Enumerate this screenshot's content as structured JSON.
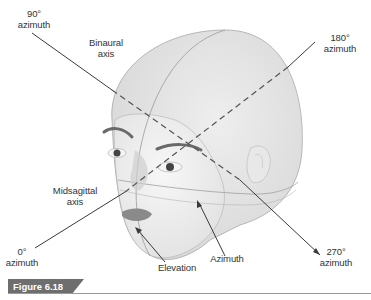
{
  "figure": {
    "caption": "Figure 6.18"
  },
  "labels": {
    "az90": {
      "line1": "90°",
      "line2": "azimuth"
    },
    "binaural": {
      "line1": "Binaural",
      "line2": "axis"
    },
    "az180": {
      "line1": "180°",
      "line2": "azimuth"
    },
    "midsagittal": {
      "line1": "Midsagittal",
      "line2": "axis"
    },
    "az0": {
      "line1": "0°",
      "line2": "azimuth"
    },
    "elevation": "Elevation",
    "azimuth": "Azimuth",
    "az270": {
      "line1": "270°",
      "line2": "azimuth"
    }
  },
  "colors": {
    "head_fill": "#e6e6e6",
    "head_outline": "#a8a8a8",
    "axis_line": "#3a3a3a",
    "caption_bg": "#6e6e6e",
    "caption_text": "#ffffff",
    "label_text": "#333333"
  }
}
